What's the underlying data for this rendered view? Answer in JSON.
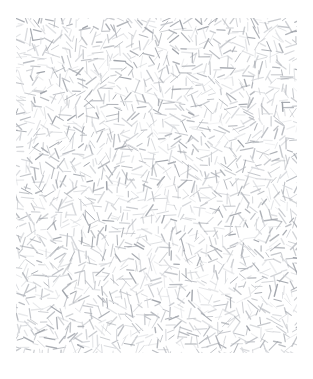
{
  "image": {
    "kind": "texture-swatch",
    "title": "Random Dash Texture Swatch",
    "width": 313,
    "height": 379,
    "background_color": "#ffffff"
  },
  "panel": {
    "name": "texture-panel",
    "x": 16,
    "y": 18,
    "width": 281,
    "height": 335,
    "fill_color": "#ffffff",
    "has_border": false
  },
  "texture": {
    "description": "Dense field of short straight dashes at randomized angles and lengths, rendered in light gray on a white ground",
    "element_kind": "line-dash",
    "stroke_color": "#b9bcc2",
    "stroke_color_light": "#d6d8dc",
    "stroke_color_dark": "#9fa3aa",
    "stroke_width_min": 0.8,
    "stroke_width_max": 1.5,
    "dash_length_min": 5,
    "dash_length_max": 13,
    "angle_range_degrees": [
      0,
      180
    ],
    "count": 1850,
    "seed": 20240517,
    "distribution": "uniform-jittered-grid",
    "cell_size": 7.0,
    "jitter": 3.4,
    "opacity_min": 0.38,
    "opacity_max": 1.0
  },
  "margins": {
    "top": 18,
    "right": 16,
    "bottom": 26,
    "left": 16
  }
}
